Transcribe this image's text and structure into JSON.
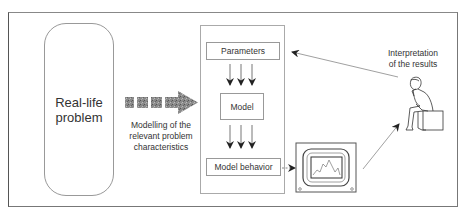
{
  "diagram": {
    "type": "process-flow",
    "nodes": {
      "real_life_problem": {
        "line1": "Real-life",
        "line2": "problem"
      },
      "modelling_caption": {
        "line1": "Modelling of the",
        "line2": "relevant problem",
        "line3": "characteristics"
      },
      "parameters": {
        "label": "Parameters"
      },
      "model": {
        "label": "Model"
      },
      "model_behavior": {
        "label": "Model behavior"
      },
      "monitor": {
        "icon": "monitor-with-graph-icon"
      },
      "person": {
        "icon": "thinking-person-icon"
      },
      "interpretation": {
        "line1": "Interpretation",
        "line2": "of the results"
      }
    },
    "edges": [
      {
        "from": "real_life_problem",
        "to": "model_panel",
        "style": "thick-textured-arrow",
        "label": "Modelling of the relevant problem characteristics"
      },
      {
        "from": "parameters",
        "to": "model",
        "style": "triple-down-arrows"
      },
      {
        "from": "model",
        "to": "model_behavior",
        "style": "triple-down-arrows"
      },
      {
        "from": "model_behavior",
        "to": "monitor",
        "style": "dashed-arrow"
      },
      {
        "from": "monitor",
        "to": "person",
        "style": "thin-arrow"
      },
      {
        "from": "person",
        "to": "parameters",
        "style": "thin-arrow",
        "label": "Interpretation of the results"
      }
    ]
  },
  "colors": {
    "frame": "#777777",
    "box_border": "#999999",
    "arrow": "#555555",
    "arrow_fill": "#8a8a8a",
    "text": "#333333"
  }
}
